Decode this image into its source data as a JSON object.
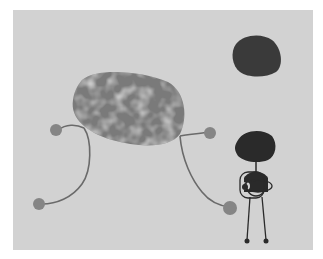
{
  "artwork": {
    "description": "Abstract painting with a large mottled oval creature on thin legs, a dark disc, and a small stick figure",
    "colors": {
      "paper": "#ffffff",
      "background": "#d2d2d2",
      "creature_body": "#7a7a7a",
      "creature_mottle": "#a8a8a8",
      "limb": "#6a6a6a",
      "foot": "#858585",
      "disc": "#3a3a3a",
      "figure": "#2a2a2a"
    }
  }
}
